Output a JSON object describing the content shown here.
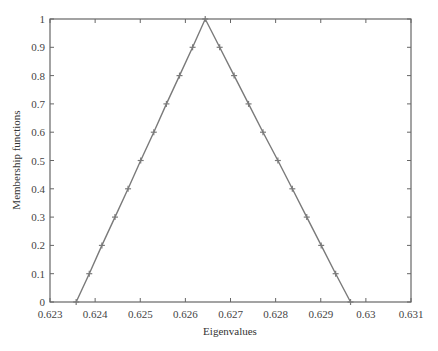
{
  "chart_data": {
    "type": "line",
    "title": "",
    "xlabel": "Eigenvalues",
    "ylabel": "Membership functions",
    "xlim": [
      0.623,
      0.631
    ],
    "ylim": [
      0,
      1
    ],
    "grid": false,
    "legend": null,
    "x_ticks": [
      "0.623",
      "0.624",
      "0.625",
      "0.626",
      "0.627",
      "0.628",
      "0.629",
      "0.63",
      "0.631"
    ],
    "y_ticks": [
      "0",
      "0.1",
      "0.2",
      "0.3",
      "0.4",
      "0.5",
      "0.6",
      "0.7",
      "0.8",
      "0.9",
      "1"
    ],
    "series": [
      {
        "name": "Triangular membership function",
        "color": "#7a7a7a",
        "marker": "+",
        "x": [
          0.62358,
          0.62387,
          0.62415,
          0.62444,
          0.62473,
          0.62501,
          0.6253,
          0.62558,
          0.62587,
          0.62616,
          0.62644,
          0.62676,
          0.62708,
          0.6274,
          0.62772,
          0.62805,
          0.62837,
          0.62869,
          0.62901,
          0.62933,
          0.62966
        ],
        "y": [
          0,
          0.1,
          0.2,
          0.3,
          0.4,
          0.5,
          0.6,
          0.7,
          0.8,
          0.9,
          1.0,
          0.9,
          0.8,
          0.7,
          0.6,
          0.5,
          0.4,
          0.3,
          0.2,
          0.1,
          0
        ]
      }
    ]
  }
}
